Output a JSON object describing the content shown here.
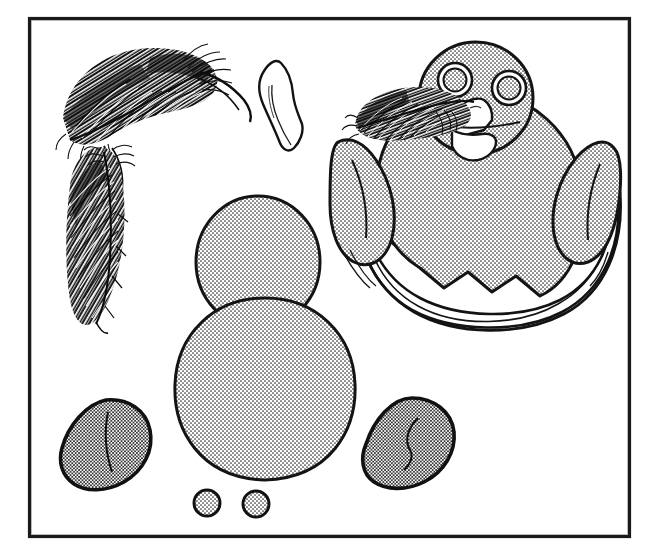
{
  "illustration": {
    "title": "Baby bird hatching from egg with craft component parts",
    "medium": "pen-and-ink line drawing with halftone stipple shading",
    "background_color": "#ffffff",
    "ink_color": "#111111",
    "stipple_fill_color": "#c9c9c9",
    "white_fill_color": "#ffffff"
  },
  "frame": {
    "label": "rectangular border",
    "x": 28,
    "y": 17,
    "width": 602,
    "height": 520,
    "stroke_width": 3,
    "stroke_color": "#1a1a1a"
  },
  "parts": [
    {
      "id": "feather-upper",
      "name": "Upper feather",
      "description": "large curved dark feather with dense barb hatching, quill sweeping right",
      "x": 58,
      "y": 48,
      "width": 165,
      "height": 105,
      "fill": "dark-hatch"
    },
    {
      "id": "feather-lower",
      "name": "Lower feather",
      "description": "narrow vertical dark feather hanging below the upper feather",
      "x": 62,
      "y": 140,
      "width": 70,
      "height": 185,
      "fill": "dark-hatch"
    },
    {
      "id": "beak-piece",
      "name": "Beak",
      "description": "unshaded elongated diamond leaf shape, white fill with fold line",
      "x": 258,
      "y": 62,
      "width": 48,
      "height": 88,
      "fill": "white"
    },
    {
      "id": "head-circle",
      "name": "Head",
      "description": "large stippled circle",
      "cx": 258,
      "cy": 262,
      "rx": 62,
      "ry": 66,
      "fill": "stipple"
    },
    {
      "id": "body-oval",
      "name": "Body",
      "description": "large stippled rounded oval below the head",
      "cx": 265,
      "cy": 390,
      "rx": 88,
      "ry": 92,
      "fill": "stipple"
    },
    {
      "id": "wing-left",
      "name": "Left wing",
      "description": "stippled teardrop wing with curved interior crease line, tip pointing lower-left",
      "x": 58,
      "y": 398,
      "width": 95,
      "height": 92,
      "fill": "stipple-dense"
    },
    {
      "id": "wing-right",
      "name": "Right wing",
      "description": "stippled teardrop wing mirrored, tip pointing lower-left",
      "x": 362,
      "y": 396,
      "width": 95,
      "height": 94,
      "fill": "stipple-dense"
    },
    {
      "id": "eye-dot-left",
      "name": "Left eye disc",
      "description": "small stippled circle",
      "cx": 207,
      "cy": 503,
      "r": 13,
      "fill": "stipple"
    },
    {
      "id": "eye-dot-right",
      "name": "Right eye disc",
      "description": "small stippled circle",
      "cx": 256,
      "cy": 504,
      "r": 13,
      "fill": "stipple"
    }
  ],
  "assembly": {
    "id": "chick-in-egg",
    "name": "Assembled chick in cracked egg shell",
    "x": 330,
    "y": 30,
    "width": 300,
    "height": 300,
    "components": [
      {
        "id": "egg-shell",
        "name": "Cracked egg shell",
        "description": "lower half of egg with jagged zigzag broken rim and double outline",
        "fill": "white"
      },
      {
        "id": "chick-body",
        "name": "Chick body",
        "description": "stippled rounded body sitting inside the shell",
        "fill": "stipple"
      },
      {
        "id": "chick-head",
        "name": "Chick head",
        "description": "stippled circle head above the body",
        "fill": "stipple"
      },
      {
        "id": "chick-eye-left",
        "name": "Chick left eye",
        "description": "ring circle with stippled inner disc",
        "fill": "stipple"
      },
      {
        "id": "chick-eye-right",
        "name": "Chick right eye",
        "description": "ring circle with stippled inner disc",
        "fill": "stipple"
      },
      {
        "id": "chick-beak",
        "name": "Chick beak",
        "description": "white open beak pointing down-left, upper and lower mandible",
        "fill": "white"
      },
      {
        "id": "chick-wing-left",
        "name": "Chick left wing",
        "description": "stippled wing raised on the left side of the body",
        "fill": "stipple"
      },
      {
        "id": "chick-wing-right",
        "name": "Chick right wing",
        "description": "stippled wing raised on the right side of the body",
        "fill": "stipple"
      },
      {
        "id": "chick-feather",
        "name": "Head feather",
        "description": "dark hatched feather tucked behind the beak pointing left",
        "fill": "dark-hatch"
      }
    ]
  }
}
